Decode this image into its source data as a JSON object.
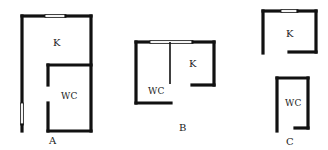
{
  "diagram": {
    "type": "floor-plan-comparison",
    "colors": {
      "wall": "#111111",
      "background": "#ffffff",
      "text": "#222222"
    },
    "plans": [
      {
        "id": "A",
        "label": "A",
        "rooms": [
          {
            "name": "kitchen",
            "label": "K"
          },
          {
            "name": "wc",
            "label": "WC"
          }
        ]
      },
      {
        "id": "B",
        "label": "B",
        "rooms": [
          {
            "name": "wc",
            "label": "WC"
          },
          {
            "name": "kitchen",
            "label": "K"
          }
        ]
      },
      {
        "id": "C",
        "label": "C",
        "rooms": [
          {
            "name": "kitchen",
            "label": "K"
          },
          {
            "name": "wc",
            "label": "WC"
          }
        ]
      }
    ]
  }
}
